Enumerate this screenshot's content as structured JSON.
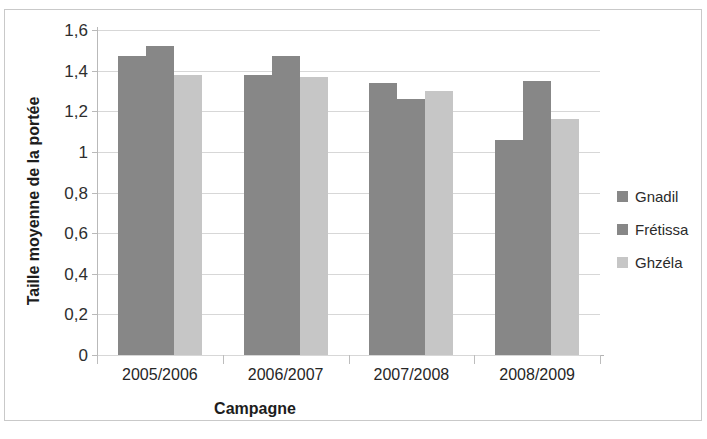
{
  "chart_data": {
    "type": "bar",
    "title": "",
    "xlabel": "Campagne",
    "ylabel": "Taille moyenne de la portée",
    "categories": [
      "2005/2006",
      "2006/2007",
      "2007/2008",
      "2008/2009"
    ],
    "series": [
      {
        "name": "Gnadil",
        "values": [
          1.47,
          1.38,
          1.34,
          1.06
        ],
        "color": "#878787"
      },
      {
        "name": "Frétissa",
        "values": [
          1.52,
          1.47,
          1.26,
          1.35
        ],
        "color": "#878787"
      },
      {
        "name": "Ghzéla",
        "values": [
          1.38,
          1.37,
          1.3,
          1.16
        ],
        "color": "#c6c6c6"
      }
    ],
    "ylim": [
      0,
      1.6
    ],
    "ytick_labels": [
      "1,6",
      "1,4",
      "1,2",
      "1",
      "0,8",
      "0,6",
      "0,4",
      "0,2",
      "0"
    ],
    "ytick_values": [
      1.6,
      1.4,
      1.2,
      1.0,
      0.8,
      0.6,
      0.4,
      0.2,
      0
    ],
    "grid": true,
    "legend_position": "right",
    "decimal_separator": ","
  },
  "legend": {
    "items": [
      {
        "label": "Gnadil"
      },
      {
        "label": "Frétissa"
      },
      {
        "label": "Ghzéla"
      }
    ]
  },
  "axes": {
    "x_title": "Campagne",
    "y_title": "Taille moyenne de la portée"
  }
}
